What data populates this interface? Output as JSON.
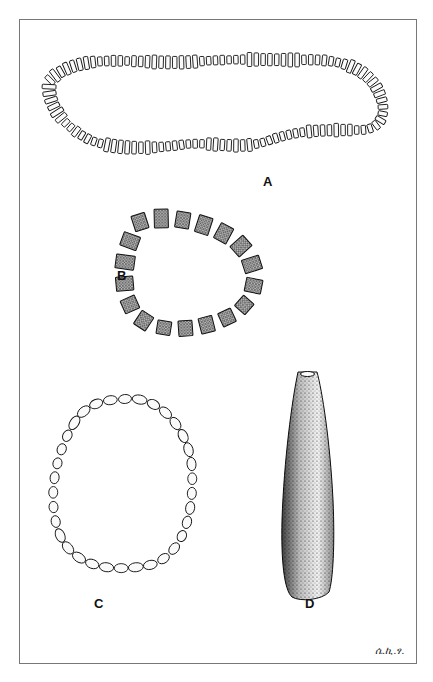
{
  "plate": {
    "figures": [
      {
        "id": "A",
        "label": "A",
        "description": "long necklace of cylindrical/disc beads"
      },
      {
        "id": "B",
        "label": "B",
        "description": "bracelet of rough stone beads"
      },
      {
        "id": "C",
        "label": "C",
        "description": "loop of small oval beads"
      },
      {
        "id": "D",
        "label": "D",
        "description": "stippled conical stone pendant"
      }
    ],
    "signature": "ሴ.ኪ.ፃ."
  },
  "colors": {
    "ink": "#111111",
    "frame": "#777777",
    "paper": "#ffffff"
  }
}
